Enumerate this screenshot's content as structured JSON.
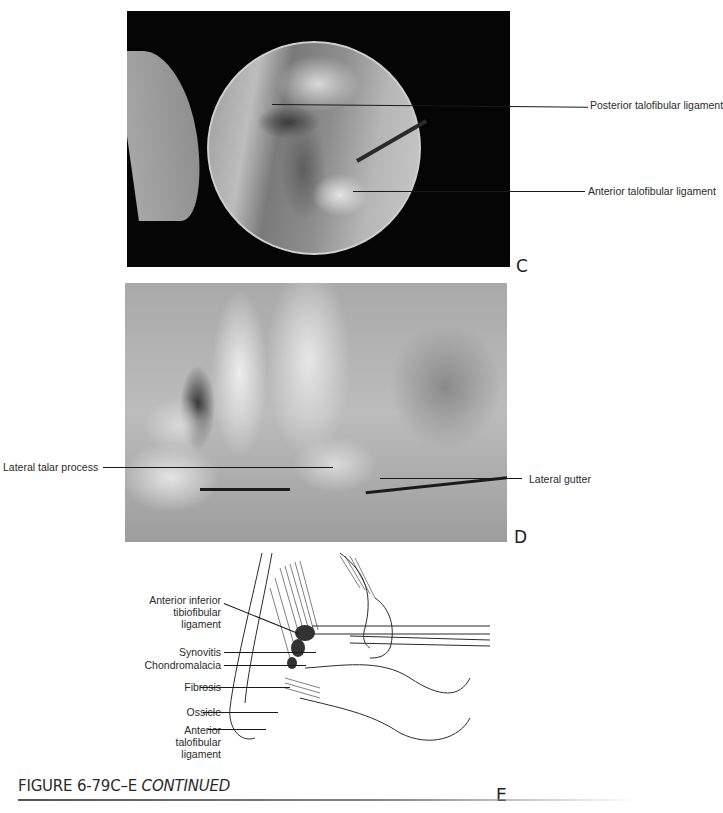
{
  "figure": {
    "caption_number": "FIGURE 6-79C–E",
    "caption_suffix": "CONTINUED"
  },
  "panels": {
    "c": {
      "letter": "C",
      "type": "arthroscopic-photograph",
      "labels": [
        {
          "text": "Posterior talofibular ligament"
        },
        {
          "text": "Anterior talofibular ligament"
        }
      ]
    },
    "d": {
      "letter": "D",
      "type": "cadaver-photograph",
      "labels": [
        {
          "text": "Lateral talar process"
        },
        {
          "text": "Lateral gutter"
        }
      ]
    },
    "e": {
      "letter": "E",
      "type": "line-illustration",
      "labels": [
        {
          "lines": [
            "Anterior inferior",
            "tibiofibular",
            "ligament"
          ]
        },
        {
          "lines": [
            "Synovitis"
          ]
        },
        {
          "lines": [
            "Chondromalacia"
          ]
        },
        {
          "lines": [
            "Fibrosis"
          ]
        },
        {
          "lines": [
            "Ossicle"
          ]
        },
        {
          "lines": [
            "Anterior",
            "talofibular",
            "ligament"
          ]
        }
      ]
    }
  },
  "colors": {
    "ink": "#222222",
    "photo_frame": "#050505",
    "background": "#ffffff"
  }
}
